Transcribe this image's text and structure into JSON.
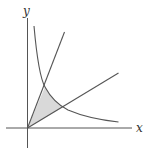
{
  "diagram": {
    "axes": {
      "x_label": "x",
      "y_label": "y"
    },
    "curves": [
      {
        "name": "steep-line",
        "description": "line through origin, steep slope"
      },
      {
        "name": "shallow-line",
        "description": "line through origin, shallow slope"
      },
      {
        "name": "hyperbola",
        "description": "decreasing curve, xy = const"
      }
    ],
    "shaded_region": {
      "description": "region bounded by the two lines and the hyperbola",
      "fill": "#d9d9d9"
    },
    "colors": {
      "stroke": "#555555",
      "fill": "#d9d9d9"
    }
  }
}
